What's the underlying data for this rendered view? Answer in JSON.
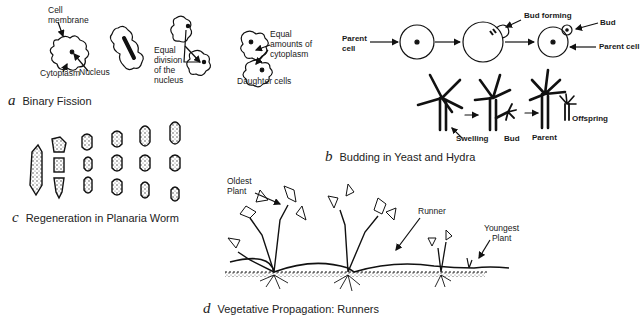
{
  "panels": {
    "a": {
      "letter": "a",
      "caption": "Binary Fission",
      "labels": {
        "cell_membrane": "Cell\nmembrane",
        "cytoplasm": "Cytoplasm",
        "nucleus": "Nucleus",
        "equal_division": "Equal\ndivision\nof the\nnucleus",
        "equal_amounts": "Equal\namounts of\ncytoplasm",
        "daughter_cells": "Daughter cells"
      }
    },
    "b": {
      "letter": "b",
      "caption": "Budding in Yeast and Hydra",
      "labels": {
        "parent_cell_left": "Parent\ncell",
        "bud_forming": "Bud forming",
        "bud": "Bud",
        "parent_cell_right": "Parent cell",
        "swelling": "Swelling",
        "hydra_bud": "Bud",
        "parent": "Parent",
        "offspring": "Offspring"
      }
    },
    "c": {
      "letter": "c",
      "caption": "Regeneration in Planaria Worm"
    },
    "d": {
      "letter": "d",
      "caption": "Vegetative Propagation: Runners",
      "labels": {
        "oldest_plant": "Oldest\nPlant",
        "runner": "Runner",
        "youngest_plant": "Youngest\nPlant"
      }
    }
  }
}
